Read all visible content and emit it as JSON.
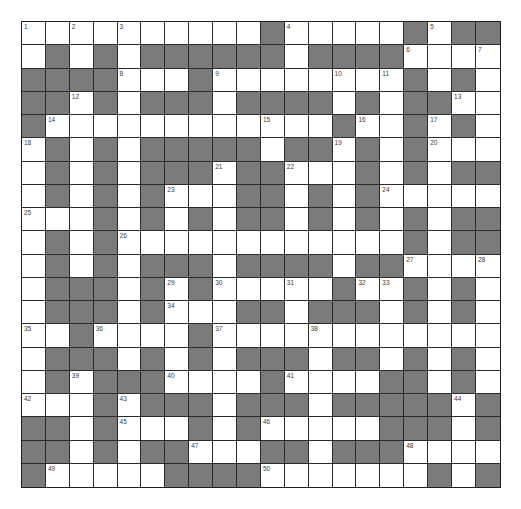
{
  "puzzle": {
    "rows": 20,
    "cols": 20,
    "colors": {
      "block": "#7b7b7b",
      "open": "#ffffff",
      "border": "#1e1e1e",
      "number": "#3a3a3a"
    },
    "grid": [
      [
        "1",
        "W",
        "2",
        "W",
        "3",
        "W",
        "W",
        "W",
        "W",
        "W",
        "B",
        "4",
        "W",
        "W",
        "W",
        "W",
        "B",
        "5",
        "B",
        "B"
      ],
      [
        "W",
        "B",
        "W",
        "B",
        "W",
        "B",
        "B",
        "B",
        "B",
        "B",
        "B",
        "W",
        "B",
        "B",
        "B",
        "B",
        "6",
        "W",
        "W",
        "7"
      ],
      [
        "B",
        "B",
        "B",
        "B",
        "8",
        "W",
        "W",
        "B",
        "9",
        "W",
        "W",
        "W",
        "W",
        "10",
        "W",
        "11",
        "B",
        "W",
        "B",
        "W"
      ],
      [
        "B",
        "B",
        "12",
        "B",
        "W",
        "B",
        "B",
        "B",
        "W",
        "B",
        "B",
        "B",
        "B",
        "W",
        "B",
        "W",
        "B",
        "B",
        "13",
        "W"
      ],
      [
        "B",
        "14",
        "W",
        "W",
        "W",
        "W",
        "W",
        "W",
        "W",
        "W",
        "15",
        "W",
        "W",
        "B",
        "16",
        "W",
        "B",
        "17",
        "B",
        "W"
      ],
      [
        "18",
        "B",
        "W",
        "B",
        "W",
        "B",
        "B",
        "B",
        "B",
        "B",
        "W",
        "B",
        "B",
        "19",
        "B",
        "W",
        "B",
        "20",
        "W",
        "W"
      ],
      [
        "W",
        "B",
        "W",
        "B",
        "W",
        "B",
        "B",
        "B",
        "21",
        "B",
        "B",
        "22",
        "W",
        "W",
        "B",
        "W",
        "B",
        "W",
        "B",
        "B"
      ],
      [
        "W",
        "B",
        "W",
        "B",
        "W",
        "B",
        "23",
        "W",
        "W",
        "B",
        "B",
        "W",
        "B",
        "W",
        "B",
        "24",
        "W",
        "W",
        "W",
        "W"
      ],
      [
        "25",
        "W",
        "W",
        "B",
        "W",
        "B",
        "W",
        "B",
        "W",
        "B",
        "B",
        "W",
        "B",
        "W",
        "B",
        "W",
        "B",
        "W",
        "B",
        "B"
      ],
      [
        "W",
        "B",
        "W",
        "B",
        "26",
        "W",
        "W",
        "W",
        "W",
        "W",
        "W",
        "W",
        "W",
        "W",
        "W",
        "W",
        "B",
        "W",
        "B",
        "B"
      ],
      [
        "W",
        "B",
        "W",
        "B",
        "W",
        "B",
        "B",
        "B",
        "W",
        "B",
        "B",
        "B",
        "B",
        "W",
        "B",
        "B",
        "27",
        "W",
        "W",
        "28"
      ],
      [
        "W",
        "B",
        "B",
        "B",
        "W",
        "B",
        "29",
        "B",
        "30",
        "W",
        "W",
        "31",
        "W",
        "B",
        "32",
        "33",
        "B",
        "W",
        "B",
        "W"
      ],
      [
        "W",
        "B",
        "B",
        "B",
        "W",
        "B",
        "34",
        "W",
        "W",
        "B",
        "B",
        "W",
        "B",
        "B",
        "B",
        "W",
        "B",
        "W",
        "B",
        "W"
      ],
      [
        "35",
        "W",
        "B",
        "36",
        "W",
        "W",
        "W",
        "B",
        "37",
        "W",
        "W",
        "W",
        "38",
        "W",
        "W",
        "W",
        "W",
        "W",
        "W",
        "W"
      ],
      [
        "W",
        "B",
        "B",
        "B",
        "W",
        "B",
        "W",
        "B",
        "W",
        "B",
        "B",
        "B",
        "W",
        "B",
        "B",
        "W",
        "B",
        "W",
        "B",
        "W"
      ],
      [
        "W",
        "B",
        "39",
        "B",
        "B",
        "B",
        "40",
        "W",
        "W",
        "W",
        "B",
        "41",
        "W",
        "W",
        "W",
        "B",
        "B",
        "W",
        "B",
        "W"
      ],
      [
        "42",
        "W",
        "W",
        "B",
        "43",
        "B",
        "B",
        "B",
        "W",
        "B",
        "B",
        "B",
        "W",
        "B",
        "B",
        "B",
        "B",
        "B",
        "44",
        "B"
      ],
      [
        "B",
        "B",
        "W",
        "B",
        "45",
        "W",
        "W",
        "B",
        "W",
        "B",
        "46",
        "W",
        "W",
        "W",
        "W",
        "B",
        "B",
        "B",
        "W",
        "B"
      ],
      [
        "B",
        "B",
        "W",
        "B",
        "W",
        "B",
        "B",
        "47",
        "W",
        "W",
        "B",
        "B",
        "W",
        "B",
        "B",
        "B",
        "48",
        "W",
        "W",
        "W"
      ],
      [
        "B",
        "49",
        "W",
        "W",
        "W",
        "W",
        "B",
        "B",
        "B",
        "B",
        "50",
        "W",
        "W",
        "W",
        "W",
        "W",
        "W",
        "B",
        "W",
        "B"
      ]
    ],
    "legend": {
      "B": "black-block",
      "W": "empty-white-cell",
      "number": "numbered-white-cell"
    }
  }
}
